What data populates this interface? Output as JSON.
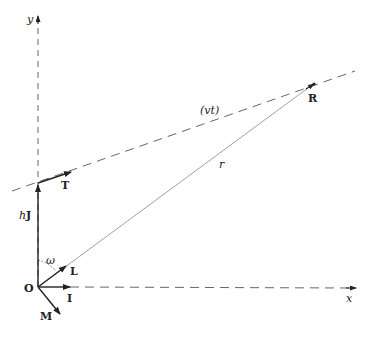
{
  "diagram": {
    "type": "vector-geometry",
    "colors": {
      "ink": "#222222",
      "thin_line": "#777777",
      "dashed": "#555555",
      "background": "#ffffff"
    },
    "axes": {
      "x_label": "x",
      "y_label": "y"
    },
    "origin": {
      "label": "O"
    },
    "vectors": {
      "hJ": {
        "label_h": "h",
        "label_J": "J"
      },
      "T": {
        "label": "T"
      },
      "L": {
        "label": "L"
      },
      "I": {
        "label": "I"
      },
      "M": {
        "label": "M"
      }
    },
    "point_R": {
      "label": "R"
    },
    "line_vt": {
      "label": "(vt)"
    },
    "line_r": {
      "label": "r"
    },
    "angle": {
      "label": "ω"
    }
  }
}
